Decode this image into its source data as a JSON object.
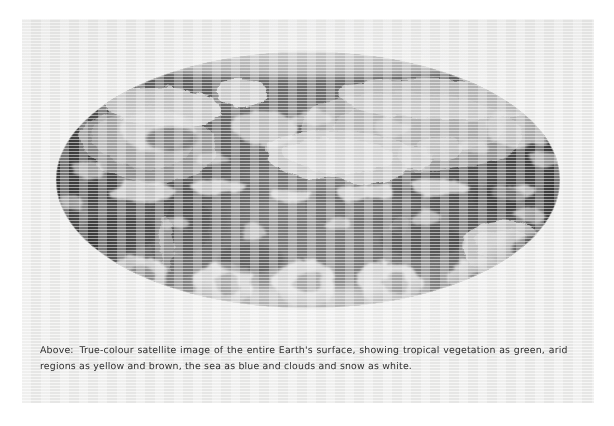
{
  "page": {
    "type": "scanned-book-page",
    "background_color": "#ffffff",
    "sheet_color": "#ececeb"
  },
  "figure": {
    "name": "earth-satellite-image",
    "rendering": "grayscale halftone print",
    "projection": "mollweide-ellipse",
    "ellipse": {
      "center_x": 286,
      "center_y": 161,
      "radius_x": 252,
      "radius_y": 128
    },
    "tones": {
      "ocean_dark": "#131313",
      "ocean_mid": "#2e2e2e",
      "land_mid": "#6e6e6e",
      "land_bright": "#b9b9b9",
      "cloud_white": "#f2f2f2",
      "snow_white": "#ffffff"
    },
    "features": [
      "tropical vegetation (dark tones)",
      "arid regions (bright grey tones)",
      "sea (very dark tones)",
      "clouds and snow (white)",
      "polar ice caps at top and bottom",
      "cyclonic cloud swirls over southern ocean",
      "Africa and Sahara at centre",
      "Australia at right",
      "Americas at left"
    ]
  },
  "caption": {
    "lead": "Above:",
    "line_1": "True-colour satellite image of the entire Earth's surface, showing tropical vegetation as green, arid",
    "line_2": "regions as yellow and brown, the sea as blue and clouds and snow as white.",
    "full_text": "Above: True-colour satellite image of the entire Earth's surface, showing tropical vegetation as green, arid regions as yellow and brown, the sea as blue and clouds and snow as white.",
    "text_color": "#2e2e2e"
  }
}
